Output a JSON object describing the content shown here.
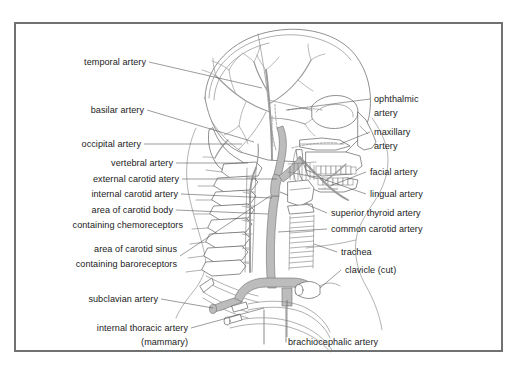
{
  "figure": {
    "border_color": "#6f7173",
    "background_color": "#ffffff",
    "ink_color": "#1b1b1b",
    "vessel_fill": "#bcbcbc",
    "vessel_stroke": "#6e6e6e",
    "bone_stroke": "#6b6b6b",
    "leader_color": "#4a4a4a"
  },
  "labels_left": [
    {
      "id": "temporal-artery",
      "text": "temporal artery"
    },
    {
      "id": "basilar-artery",
      "text": "basilar artery"
    },
    {
      "id": "occipital-artery",
      "text": "occipital artery"
    },
    {
      "id": "vertebral-artery",
      "text": "vertebral artery"
    },
    {
      "id": "external-carotid-artery",
      "text": "external carotid atery"
    },
    {
      "id": "internal-carotid-artery",
      "text": "internal carotid artery"
    },
    {
      "id": "carotid-body-line1",
      "text": "area of carotid body"
    },
    {
      "id": "carotid-body-line2",
      "text": "containing chemoreceptors"
    },
    {
      "id": "carotid-sinus-line1",
      "text": "area of carotid sinus"
    },
    {
      "id": "carotid-sinus-line2",
      "text": "containing baroreceptors"
    },
    {
      "id": "subclavian-artery",
      "text": "subclavian artery"
    },
    {
      "id": "internal-thoracic-artery-line1",
      "text": "internal thoracic artery"
    },
    {
      "id": "internal-thoracic-artery-line2",
      "text": "(mammary)"
    }
  ],
  "labels_right": [
    {
      "id": "ophthalmic-artery-line1",
      "text": "ophthalmic"
    },
    {
      "id": "ophthalmic-artery-line2",
      "text": "artery"
    },
    {
      "id": "maxillary-artery-line1",
      "text": "maxillary"
    },
    {
      "id": "maxillary-artery-line2",
      "text": "artery"
    },
    {
      "id": "facial-artery",
      "text": "facial artery"
    },
    {
      "id": "lingual-artery",
      "text": "lingual artery"
    },
    {
      "id": "superior-thyroid-artery",
      "text": "superior thyroid artery"
    },
    {
      "id": "common-carotid-artery",
      "text": "common carotid artery"
    },
    {
      "id": "trachea",
      "text": "trachea"
    },
    {
      "id": "clavicle-cut",
      "text": "clavicle (cut)"
    }
  ],
  "labels_bottom": [
    {
      "id": "brachiocephalic-artery",
      "text": "brachiocephalic artery"
    }
  ],
  "inline_annotation": {
    "mandible_note": "mandibular canal"
  }
}
